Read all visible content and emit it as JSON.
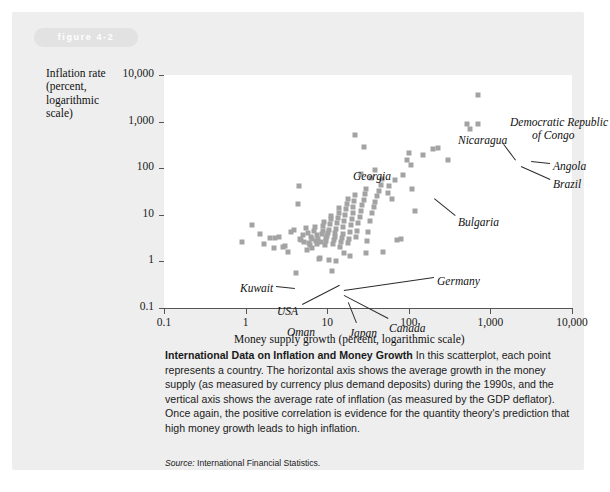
{
  "figure": {
    "tag": "figure 4-2"
  },
  "chart_data": {
    "type": "scatter",
    "title": "",
    "xlabel": "Money supply growth (percent, logarithmic scale)",
    "ylabel": "Inflation rate (percent, logarithmic scale)",
    "ylabel_lines": [
      "Inflation rate",
      "(percent,",
      "logarithmic",
      "scale)"
    ],
    "xscale": "log",
    "yscale": "log",
    "xlim": [
      0.1,
      10000
    ],
    "ylim": [
      0.1,
      10000
    ],
    "xticks": [
      "0.1",
      "1",
      "10",
      "100",
      "1,000",
      "10,000"
    ],
    "xtick_values": [
      0.1,
      1,
      10,
      100,
      1000,
      10000
    ],
    "yticks": [
      "0.1",
      "1",
      "10",
      "100",
      "1,000",
      "10,000"
    ],
    "ytick_values": [
      0.1,
      1,
      10,
      100,
      1000,
      10000
    ],
    "grid": false,
    "legend": "none",
    "marker": {
      "shape": "square",
      "color": "#a3a3a3",
      "size_px": 5
    },
    "annotations": [
      {
        "label": "Democratic Republic of Congo",
        "x": 700,
        "y": 3800,
        "lines": [
          "Democratic Republic",
          "of Congo"
        ]
      },
      {
        "label": "Nicaragua",
        "x": 520,
        "y": 900
      },
      {
        "label": "Angola",
        "x": 700,
        "y": 900
      },
      {
        "label": "Brazil",
        "x": 560,
        "y": 700
      },
      {
        "label": "Georgia",
        "x": 22,
        "y": 1400
      },
      {
        "label": "Bulgaria",
        "x": 110,
        "y": 130
      },
      {
        "label": "Germany",
        "x": 9.5,
        "y": 3.2
      },
      {
        "label": "Kuwait",
        "x": 2.6,
        "y": 3.4
      },
      {
        "label": "USA",
        "x": 3.4,
        "y": 1.5
      },
      {
        "label": "Oman",
        "x": 4.2,
        "y": 0.55
      },
      {
        "label": "Japan",
        "x": 11.5,
        "y": 0.6
      },
      {
        "label": "Canada",
        "x": 30,
        "y": 0.65
      }
    ],
    "points_xy": [
      [
        0.9,
        2.6
      ],
      [
        1.2,
        6.0
      ],
      [
        1.5,
        3.8
      ],
      [
        1.7,
        2.4
      ],
      [
        2.0,
        3.2
      ],
      [
        2.3,
        3.2
      ],
      [
        2.6,
        3.3
      ],
      [
        2.9,
        2.0
      ],
      [
        3.3,
        1.6
      ],
      [
        3.6,
        4.2
      ],
      [
        3.9,
        4.8
      ],
      [
        4.2,
        0.55
      ],
      [
        4.4,
        17
      ],
      [
        4.5,
        42
      ],
      [
        4.6,
        3.0
      ],
      [
        4.8,
        2.9
      ],
      [
        5.0,
        3.6
      ],
      [
        5.2,
        2.6
      ],
      [
        5.5,
        5.2
      ],
      [
        5.8,
        4.0
      ],
      [
        6.0,
        2.5
      ],
      [
        6.2,
        2.2
      ],
      [
        6.4,
        3.4
      ],
      [
        6.6,
        3.1
      ],
      [
        6.8,
        4.5
      ],
      [
        7.0,
        5.5
      ],
      [
        7.2,
        2.8
      ],
      [
        7.4,
        2.4
      ],
      [
        7.6,
        3.6
      ],
      [
        7.8,
        3.0
      ],
      [
        8.0,
        1.1
      ],
      [
        8.2,
        1.2
      ],
      [
        8.4,
        2.6
      ],
      [
        8.6,
        3.9
      ],
      [
        8.8,
        4.6
      ],
      [
        9.0,
        5.8
      ],
      [
        9.2,
        7.0
      ],
      [
        9.4,
        2.2
      ],
      [
        9.6,
        2.7
      ],
      [
        9.8,
        3.2
      ],
      [
        10.0,
        3.5
      ],
      [
        10.2,
        4.1
      ],
      [
        10.5,
        4.8
      ],
      [
        10.8,
        6.2
      ],
      [
        11.0,
        8.0
      ],
      [
        11.2,
        9.5
      ],
      [
        11.5,
        0.62
      ],
      [
        11.8,
        2.4
      ],
      [
        12.0,
        2.9
      ],
      [
        12.3,
        3.4
      ],
      [
        12.6,
        4.0
      ],
      [
        12.9,
        5.0
      ],
      [
        13.2,
        6.6
      ],
      [
        13.5,
        8.5
      ],
      [
        13.8,
        11
      ],
      [
        14.0,
        14
      ],
      [
        14.3,
        2.0
      ],
      [
        14.6,
        2.6
      ],
      [
        15.0,
        3.2
      ],
      [
        15.4,
        3.9
      ],
      [
        15.8,
        5.4
      ],
      [
        16.2,
        7.5
      ],
      [
        16.6,
        10
      ],
      [
        17.0,
        13
      ],
      [
        17.4,
        17
      ],
      [
        17.8,
        22
      ],
      [
        18.0,
        2.5
      ],
      [
        18.5,
        3.0
      ],
      [
        19.0,
        4.3
      ],
      [
        19.5,
        6.0
      ],
      [
        20.0,
        8.2
      ],
      [
        20.5,
        11
      ],
      [
        21.0,
        15
      ],
      [
        21.5,
        20
      ],
      [
        22.0,
        26
      ],
      [
        22.5,
        3.4
      ],
      [
        23.0,
        4.6
      ],
      [
        24.0,
        6.8
      ],
      [
        25.0,
        9.0
      ],
      [
        26.0,
        12
      ],
      [
        27.0,
        16
      ],
      [
        28.0,
        21
      ],
      [
        29.0,
        28
      ],
      [
        30.0,
        36
      ],
      [
        31.0,
        2.8
      ],
      [
        32.0,
        4.2
      ],
      [
        33.0,
        7.2
      ],
      [
        35.0,
        11
      ],
      [
        37.0,
        15
      ],
      [
        39.0,
        19
      ],
      [
        41.0,
        25
      ],
      [
        43.0,
        33
      ],
      [
        45.0,
        44
      ],
      [
        47.0,
        58
      ],
      [
        22.0,
        520
      ],
      [
        28.0,
        290
      ],
      [
        26.0,
        75
      ],
      [
        34.0,
        62
      ],
      [
        38.0,
        90
      ],
      [
        55.0,
        30
      ],
      [
        58.0,
        42
      ],
      [
        62.0,
        22
      ],
      [
        68.0,
        55
      ],
      [
        72.0,
        2.9
      ],
      [
        80.0,
        3.0
      ],
      [
        85.0,
        70
      ],
      [
        95.0,
        150
      ],
      [
        100.0,
        210
      ],
      [
        105.0,
        120
      ],
      [
        110.0,
        36
      ],
      [
        120.0,
        12
      ],
      [
        150.0,
        190
      ],
      [
        200.0,
        260
      ],
      [
        230.0,
        270
      ],
      [
        300.0,
        150
      ],
      [
        520.0,
        900
      ],
      [
        560.0,
        700
      ],
      [
        700.0,
        900
      ],
      [
        700.0,
        3800
      ],
      [
        10.5,
        1.05
      ],
      [
        13.0,
        1.0
      ],
      [
        30.0,
        1.5
      ],
      [
        48.0,
        1.6
      ],
      [
        16.0,
        1.5
      ],
      [
        19.0,
        1.3
      ],
      [
        6.5,
        1.9
      ],
      [
        5.6,
        1.8
      ],
      [
        3.0,
        2.1
      ],
      [
        2.2,
        1.9
      ]
    ]
  },
  "caption": {
    "title": "International Data on Inflation and Money Growth",
    "body": " In this scatterplot, each point represents a country. The horizontal axis shows the average growth in the money supply (as measured by currency plus demand deposits) during the 1990s, and the vertical axis shows the average rate of inflation (as measured by the GDP deflator). Once again, the positive correlation is evidence for the quantity theory's prediction that high money growth leads to high inflation.",
    "source_label": "Source:",
    "source_text": " International Financial Statistics."
  }
}
